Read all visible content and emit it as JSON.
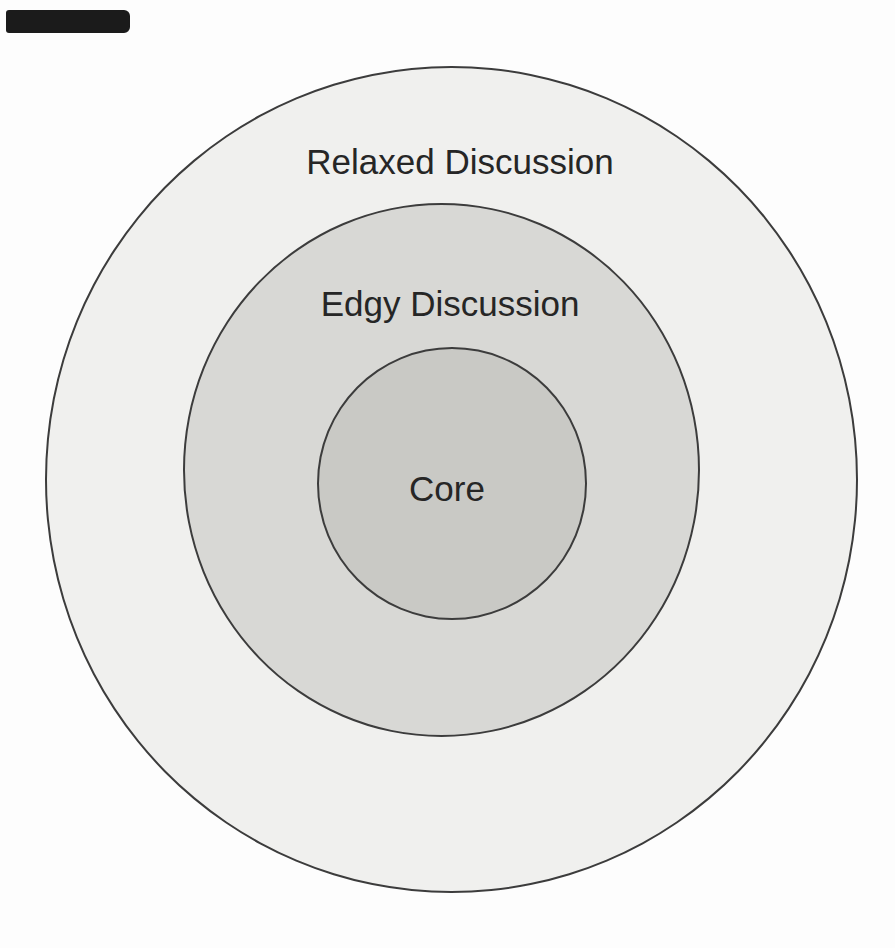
{
  "diagram": {
    "type": "concentric-circles",
    "rings": [
      {
        "id": "relaxed-discussion",
        "label": "Relaxed Discussion",
        "fill": "#f0f0ee"
      },
      {
        "id": "edgy-discussion",
        "label": "Edgy Discussion",
        "fill": "#d8d8d5"
      },
      {
        "id": "core",
        "label": "Core",
        "fill": "#c9c9c5"
      }
    ],
    "stroke_color": "#3c3c3c",
    "label_color": "#262626"
  },
  "decorations": {
    "redaction_bar_color": "#1b1b1b"
  }
}
